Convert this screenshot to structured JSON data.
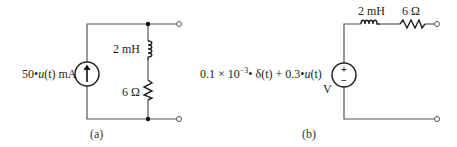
{
  "circuit_a": {
    "caption": "(a)",
    "source": {
      "type": "current-source",
      "label_num": "50",
      "label_fn": "u",
      "label_arg": "(t)",
      "label_unit": " mA"
    },
    "inductor": {
      "label": "2 mH"
    },
    "resistor": {
      "label": "6 Ω"
    }
  },
  "circuit_b": {
    "caption": "(b)",
    "source": {
      "type": "voltage-source",
      "label_expr_1": "0.1 × 10",
      "label_exp": "−3",
      "label_expr_2": "• δ(t) + 0.3•",
      "label_fn": "u",
      "label_arg": "(t)",
      "label_unit": "V",
      "plus": "+",
      "minus": "−"
    },
    "inductor": {
      "label": "2 mH"
    },
    "resistor": {
      "label": "6 Ω"
    }
  }
}
